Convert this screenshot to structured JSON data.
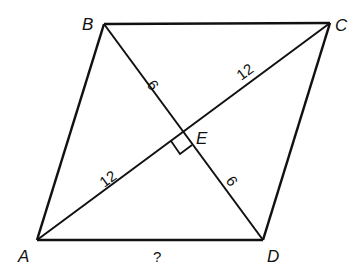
{
  "diagram": {
    "type": "rhombus-with-diagonals",
    "stroke_color": "#111111",
    "vertices": {
      "A": {
        "label": "A",
        "x": 37,
        "y": 240
      },
      "B": {
        "label": "B",
        "x": 104,
        "y": 24
      },
      "C": {
        "label": "C",
        "x": 330,
        "y": 23
      },
      "D": {
        "label": "D",
        "x": 263,
        "y": 240
      },
      "E": {
        "label": "E",
        "x": 183,
        "y": 132
      }
    },
    "segment_labels": {
      "BE": "9",
      "ED": "9",
      "AE": "12",
      "EC": "12",
      "AD": "?"
    },
    "right_angle_at": "E"
  }
}
